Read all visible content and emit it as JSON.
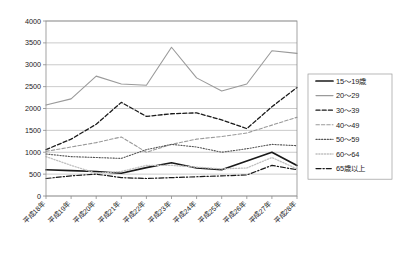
{
  "chart_data": {
    "type": "line",
    "title": "",
    "subtitle": "",
    "xlabel": "",
    "ylabel": "",
    "ylim": [
      0,
      4000
    ],
    "ytick_step": 500,
    "yticks": [
      "0",
      "500",
      "1000",
      "1500",
      "2000",
      "2500",
      "3000",
      "3500",
      "4000"
    ],
    "grid": true,
    "legend_position": "right",
    "categories": [
      "平成18年",
      "平成19年",
      "平成20年",
      "平成21年",
      "平成22年",
      "平成23年",
      "平成24年",
      "平成25年",
      "平成26年",
      "平成27年",
      "平成28年"
    ],
    "series": [
      {
        "name": "15〜19歳",
        "style": "solid",
        "color": "#1a1a1a",
        "width": 1.7,
        "values": [
          600,
          580,
          560,
          520,
          650,
          760,
          640,
          600,
          800,
          1000,
          700
        ]
      },
      {
        "name": "20〜29",
        "style": "solid",
        "color": "#9a9a9a",
        "width": 1.1,
        "values": [
          2080,
          2220,
          2740,
          2560,
          2530,
          3400,
          2700,
          2400,
          2560,
          3320,
          3260
        ]
      },
      {
        "name": "30〜39",
        "style": "dashed",
        "color": "#1a1a1a",
        "width": 1.3,
        "values": [
          1060,
          1300,
          1640,
          2140,
          1820,
          1880,
          1900,
          1740,
          1540,
          2040,
          2480
        ]
      },
      {
        "name": "40〜49",
        "style": "dashed",
        "color": "#9a9a9a",
        "width": 1.1,
        "values": [
          1020,
          1120,
          1220,
          1350,
          1000,
          1180,
          1300,
          1360,
          1440,
          1620,
          1800
        ]
      },
      {
        "name": "50〜59",
        "style": "dotted",
        "color": "#555555",
        "width": 1.1,
        "values": [
          960,
          900,
          880,
          860,
          1060,
          1180,
          1120,
          1000,
          1080,
          1180,
          1150
        ]
      },
      {
        "name": "60〜64",
        "style": "dotted",
        "color": "#c0c0c0",
        "width": 1.3,
        "values": [
          900,
          700,
          520,
          560,
          700,
          700,
          660,
          620,
          640,
          880,
          620
        ]
      },
      {
        "name": "65歳以上",
        "style": "dashdot",
        "color": "#1a1a1a",
        "width": 1.2,
        "values": [
          400,
          460,
          500,
          420,
          400,
          420,
          440,
          460,
          480,
          700,
          600
        ]
      }
    ]
  },
  "axis": {
    "y_max_label": "4000",
    "y_min_label": "0"
  }
}
